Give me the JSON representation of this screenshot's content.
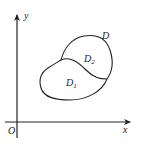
{
  "diagram": {
    "type": "region-diagram",
    "axes": {
      "x_label": "x",
      "y_label": "y",
      "origin_label": "O"
    },
    "region": {
      "label": "D",
      "subregions": [
        {
          "label": "D",
          "subscript": "2",
          "position": "upper"
        },
        {
          "label": "D",
          "subscript": "1",
          "position": "lower"
        }
      ]
    },
    "colors": {
      "stroke": "#222222",
      "background": "#ffffff"
    }
  }
}
